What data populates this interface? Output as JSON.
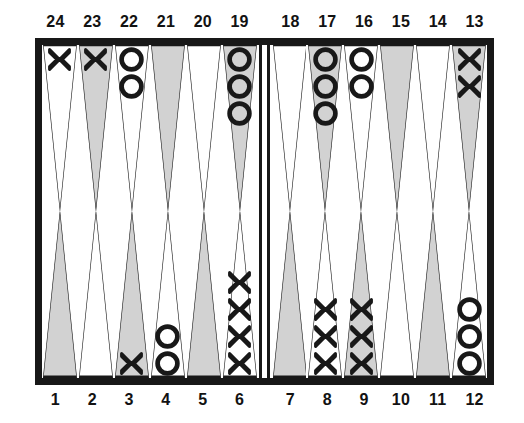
{
  "figure": {
    "checker_glyphs": {
      "player_x": "X",
      "player_o": "O"
    },
    "colors": {
      "frame": "#181818",
      "point_shaded": "#d2d2d2",
      "point_light": "#ffffff",
      "outline": "#181818",
      "label_text": "#121212",
      "background": "#ffffff"
    }
  },
  "board": {
    "top_row_labels": [
      "24",
      "23",
      "22",
      "21",
      "20",
      "19",
      "18",
      "17",
      "16",
      "15",
      "14",
      "13"
    ],
    "bottom_row_labels": [
      "1",
      "2",
      "3",
      "4",
      "5",
      "6",
      "7",
      "8",
      "9",
      "10",
      "11",
      "12"
    ],
    "points": {
      "top_left_quadrant": [
        {
          "label": "24",
          "shade": "light",
          "checker": "X",
          "count": 1
        },
        {
          "label": "23",
          "shade": "shaded",
          "checker": "X",
          "count": 1
        },
        {
          "label": "22",
          "shade": "light",
          "checker": "O",
          "count": 2
        },
        {
          "label": "21",
          "shade": "shaded",
          "checker": "",
          "count": 0
        },
        {
          "label": "20",
          "shade": "light",
          "checker": "",
          "count": 0
        },
        {
          "label": "19",
          "shade": "shaded",
          "checker": "O",
          "count": 3
        }
      ],
      "top_right_quadrant": [
        {
          "label": "18",
          "shade": "light",
          "checker": "",
          "count": 0
        },
        {
          "label": "17",
          "shade": "shaded",
          "checker": "O",
          "count": 3
        },
        {
          "label": "16",
          "shade": "light",
          "checker": "O",
          "count": 2
        },
        {
          "label": "15",
          "shade": "shaded",
          "checker": "",
          "count": 0
        },
        {
          "label": "14",
          "shade": "light",
          "checker": "",
          "count": 0
        },
        {
          "label": "13",
          "shade": "shaded",
          "checker": "X",
          "count": 2
        }
      ],
      "bottom_left_quadrant": [
        {
          "label": "1",
          "shade": "shaded",
          "checker": "",
          "count": 0
        },
        {
          "label": "2",
          "shade": "light",
          "checker": "",
          "count": 0
        },
        {
          "label": "3",
          "shade": "shaded",
          "checker": "X",
          "count": 1
        },
        {
          "label": "4",
          "shade": "light",
          "checker": "O",
          "count": 2
        },
        {
          "label": "5",
          "shade": "shaded",
          "checker": "",
          "count": 0
        },
        {
          "label": "6",
          "shade": "light",
          "checker": "X",
          "count": 4
        }
      ],
      "bottom_right_quadrant": [
        {
          "label": "7",
          "shade": "shaded",
          "checker": "",
          "count": 0
        },
        {
          "label": "8",
          "shade": "light",
          "checker": "X",
          "count": 3
        },
        {
          "label": "9",
          "shade": "shaded",
          "checker": "X",
          "count": 3
        },
        {
          "label": "10",
          "shade": "light",
          "checker": "",
          "count": 0
        },
        {
          "label": "11",
          "shade": "shaded",
          "checker": "",
          "count": 0
        },
        {
          "label": "12",
          "shade": "light",
          "checker": "O",
          "count": 3
        }
      ]
    },
    "bar": {
      "name": "center-bar",
      "checkers_on_bar": 0
    }
  }
}
